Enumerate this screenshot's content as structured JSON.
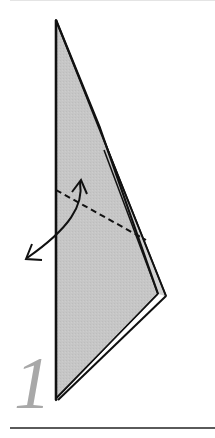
{
  "diagram": {
    "type": "origami-step",
    "step_number": "1",
    "colors": {
      "paper_fill": "#c4c4c4",
      "outline": "#111111",
      "step_number": "#a8a8a8",
      "rule": "#5a5a5a"
    },
    "elements": {
      "paper": "kite-shaped folded paper",
      "fold_line": "dashed valley fold line",
      "arrow": "curved two-headed fold-and-unfold arrow"
    }
  }
}
